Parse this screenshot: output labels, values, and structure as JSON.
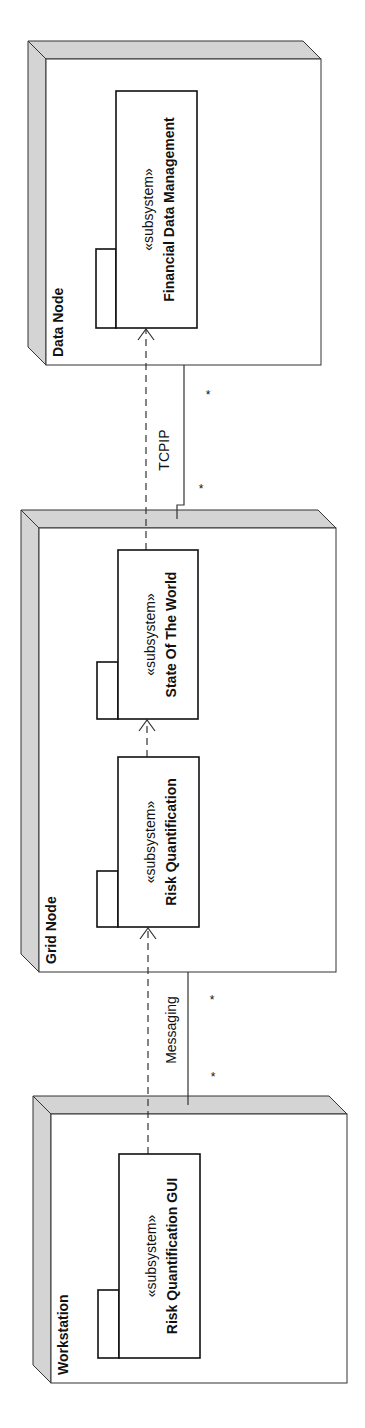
{
  "diagram": {
    "type": "uml-deployment",
    "orientation": "rotated-90-ccw",
    "colors": {
      "node_side": "#d4d4d4",
      "stroke": "#333333",
      "background": "#ffffff"
    },
    "nodes": [
      {
        "id": "data-node",
        "label": "Data Node",
        "front": {
          "x": 46,
          "y": 59,
          "w": 275,
          "h": 306
        },
        "depth": 18
      },
      {
        "id": "grid-node",
        "label": "Grid Node",
        "front": {
          "x": 39,
          "y": 528,
          "w": 297,
          "h": 444
        },
        "depth": 18
      },
      {
        "id": "workstation",
        "label": "Workstation",
        "front": {
          "x": 51,
          "y": 1114,
          "w": 296,
          "h": 269
        },
        "depth": 18
      }
    ],
    "components": [
      {
        "id": "financial-data-management",
        "stereotype": "«subsystem»",
        "name": "Financial Data Management",
        "box": {
          "x": 116,
          "y": 91,
          "w": 81,
          "h": 237
        },
        "tab": {
          "x": 96,
          "y": 249,
          "w": 20,
          "h": 79
        }
      },
      {
        "id": "state-of-the-world",
        "stereotype": "«subsystem»",
        "name": "State Of The World",
        "box": {
          "x": 118,
          "y": 550,
          "w": 80,
          "h": 169
        },
        "tab": {
          "x": 97,
          "y": 662,
          "w": 21,
          "h": 57
        }
      },
      {
        "id": "risk-quantification",
        "stereotype": "«subsystem»",
        "name": "Risk Quantification",
        "box": {
          "x": 118,
          "y": 757,
          "w": 81,
          "h": 170
        },
        "tab": {
          "x": 97,
          "y": 871,
          "w": 21,
          "h": 56
        }
      },
      {
        "id": "risk-quantification-gui",
        "stereotype": "«subsystem»",
        "name": "Risk Quantification GUI",
        "box": {
          "x": 119,
          "y": 1154,
          "w": 81,
          "h": 204
        },
        "tab": {
          "x": 98,
          "y": 1290,
          "w": 21,
          "h": 68
        }
      }
    ],
    "dependencies": [
      {
        "from": "state-of-the-world",
        "to": "financial-data-management",
        "x": 146,
        "y1": 550,
        "y2": 329
      },
      {
        "from": "risk-quantification",
        "to": "state-of-the-world",
        "x": 147,
        "y1": 757,
        "y2": 720
      },
      {
        "from": "risk-quantification-gui",
        "to": "risk-quantification",
        "x": 148,
        "y1": 1154,
        "y2": 928
      }
    ],
    "connections": [
      {
        "id": "tcpip",
        "label": "TCPIP",
        "label_pos": {
          "x": 165,
          "y": 450
        },
        "path": "M184,365 L184,505 L177,505 L177,519",
        "multiplicities": [
          {
            "text": "*",
            "x": 208,
            "y": 399
          },
          {
            "text": "*",
            "x": 201,
            "y": 493
          }
        ]
      },
      {
        "id": "messaging",
        "label": "Messaging",
        "label_pos": {
          "x": 172,
          "y": 1030
        },
        "path": "M188,972 L188,1105",
        "multiplicities": [
          {
            "text": "*",
            "x": 212,
            "y": 1004
          },
          {
            "text": "*",
            "x": 213,
            "y": 1081
          }
        ]
      }
    ]
  }
}
